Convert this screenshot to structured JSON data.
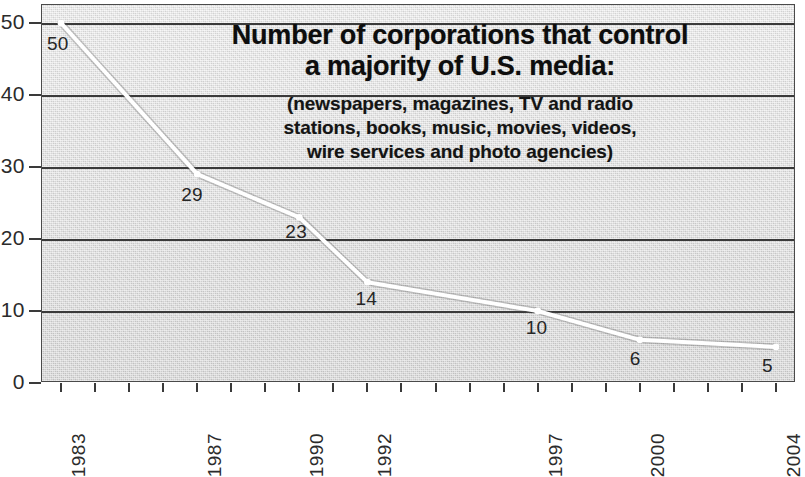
{
  "chart_data": {
    "type": "line",
    "title_lines": [
      "Number of corporations that control",
      "a majority of U.S. media:"
    ],
    "subtitle": "(newspapers, magazines, TV and radio stations, books, music, movies, videos, wire services and photo agencies)",
    "subtitle_lines": [
      "(newspapers, magazines, TV and radio",
      "stations, books, music, movies, videos,",
      "wire services and photo agencies)"
    ],
    "xlabel": "",
    "ylabel": "",
    "x": [
      1983,
      1987,
      1990,
      1992,
      1997,
      2000,
      2004
    ],
    "categories": [
      "1983",
      "1987",
      "1990",
      "1992",
      "1997",
      "2000",
      "2004"
    ],
    "values": [
      50,
      29,
      23,
      14,
      10,
      6,
      5
    ],
    "point_labels": [
      "50",
      "29",
      "23",
      "14",
      "10",
      "6",
      "5"
    ],
    "xlim": [
      1983,
      2004
    ],
    "ylim": [
      0,
      50
    ],
    "y_ticks": [
      0,
      10,
      20,
      30,
      40,
      50
    ],
    "y_tick_labels": [
      "0",
      "10",
      "20",
      "30",
      "40",
      "50"
    ],
    "x_tick_years": [
      1983,
      1984,
      1985,
      1986,
      1987,
      1988,
      1989,
      1990,
      1991,
      1992,
      1993,
      1994,
      1995,
      1996,
      1997,
      1998,
      1999,
      2000,
      2001,
      2002,
      2003,
      2004
    ],
    "x_tick_labels_shown": [
      "1983",
      "1987",
      "1990",
      "1992",
      "1997",
      "2000",
      "2004"
    ],
    "grid": "horizontal",
    "legend": "none",
    "series": [
      {
        "name": "Number of corporations",
        "values": [
          50,
          29,
          23,
          14,
          10,
          6,
          5
        ]
      }
    ],
    "colors": {
      "line": "#ffffff",
      "line_outline": "#5a5a5a",
      "marker": "#ffffff",
      "plot_background": "#dcdcdc",
      "gridline": "#3a3a3a",
      "axis": "#3a3a3a",
      "text": "#1a1a1a",
      "page_background": "#ffffff"
    }
  }
}
